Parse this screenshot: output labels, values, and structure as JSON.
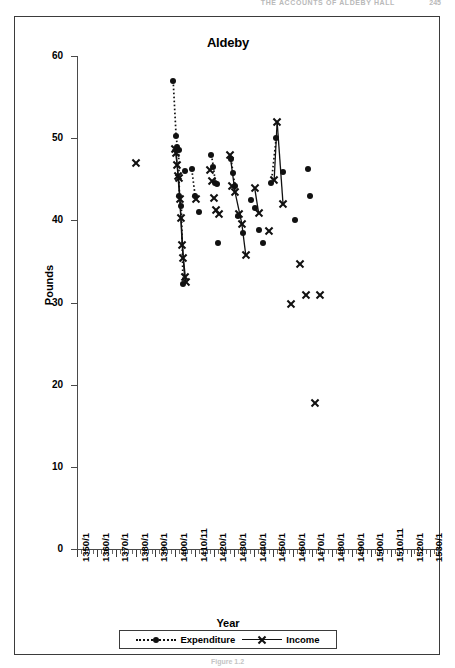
{
  "page": {
    "running_header": "THE ACCOUNTS OF ALDEBY HALL",
    "folio": "245",
    "figure_caption": "Figure 1.2"
  },
  "chart_data": {
    "type": "scatter",
    "title": "Aldeby",
    "xlabel": "Year",
    "ylabel": "Pounds",
    "ylim": [
      0,
      60
    ],
    "ytick_values": [
      0,
      10,
      20,
      30,
      40,
      50,
      60
    ],
    "ytick_labels": [
      "0",
      "10",
      "20",
      "30",
      "40",
      "50",
      "60"
    ],
    "xlim": [
      1350,
      1535
    ],
    "xtick_values": [
      1350,
      1360,
      1370,
      1380,
      1390,
      1400,
      1410,
      1420,
      1430,
      1440,
      1450,
      1460,
      1470,
      1480,
      1490,
      1500,
      1510,
      1520,
      1530
    ],
    "xtick_labels": [
      "1350/1",
      "1360/1",
      "1370/1",
      "1380/1",
      "1390/1",
      "1400/1",
      "1410/11",
      "1420/1",
      "1430/1",
      "1440/1",
      "1450/1",
      "1460/1",
      "1470/1",
      "1480/1",
      "1490/1",
      "1500/1",
      "1510/11",
      "1520/1",
      "1530/1"
    ],
    "minor_tick_step": 2,
    "grid": false,
    "legend_position": "bottom",
    "marker_expenditure": "filled-circle",
    "marker_income": "cross-x",
    "linestyle_expenditure": "dotted",
    "linestyle_income": "solid",
    "color": "#111111",
    "series": [
      {
        "name": "Expenditure",
        "points": [
          [
            1399.0,
            57.0
          ],
          [
            1400.5,
            50.3
          ],
          [
            1401.2,
            48.9
          ],
          [
            1401.8,
            48.6
          ],
          [
            1402.2,
            43.0
          ],
          [
            1403.2,
            41.8
          ],
          [
            1404.0,
            32.2
          ],
          [
            1405.0,
            46.0
          ],
          [
            1408.5,
            46.2
          ],
          [
            1410.2,
            43.0
          ],
          [
            1412.0,
            41.0
          ],
          [
            1418.5,
            48.0
          ],
          [
            1419.5,
            46.5
          ],
          [
            1420.5,
            44.6
          ],
          [
            1421.5,
            44.4
          ],
          [
            1422.0,
            37.2
          ],
          [
            1428.5,
            47.5
          ],
          [
            1429.5,
            45.8
          ],
          [
            1430.5,
            44.2
          ],
          [
            1432.0,
            40.5
          ],
          [
            1434.5,
            38.5
          ],
          [
            1438.5,
            42.5
          ],
          [
            1440.5,
            41.5
          ],
          [
            1443.0,
            38.8
          ],
          [
            1445.0,
            37.3
          ],
          [
            1449.0,
            44.5
          ],
          [
            1451.5,
            50.0
          ],
          [
            1455.0,
            45.9
          ],
          [
            1461.0,
            40.0
          ],
          [
            1467.5,
            46.2
          ],
          [
            1468.5,
            43.0
          ]
        ]
      },
      {
        "name": "Income",
        "points": [
          [
            1380.0,
            47.0
          ],
          [
            1400.0,
            48.7
          ],
          [
            1400.6,
            48.3
          ],
          [
            1401.0,
            46.8
          ],
          [
            1401.4,
            45.5
          ],
          [
            1401.8,
            45.2
          ],
          [
            1402.4,
            42.6
          ],
          [
            1403.0,
            40.3
          ],
          [
            1403.6,
            37.0
          ],
          [
            1404.2,
            35.5
          ],
          [
            1404.8,
            33.2
          ],
          [
            1405.4,
            32.6
          ],
          [
            1410.5,
            42.7
          ],
          [
            1418.0,
            46.2
          ],
          [
            1419.0,
            44.8
          ],
          [
            1420.0,
            42.8
          ],
          [
            1421.0,
            41.3
          ],
          [
            1422.5,
            40.8
          ],
          [
            1428.0,
            48.0
          ],
          [
            1429.0,
            44.2
          ],
          [
            1430.5,
            43.5
          ],
          [
            1432.5,
            40.8
          ],
          [
            1434.0,
            39.6
          ],
          [
            1436.0,
            35.8
          ],
          [
            1440.5,
            44.0
          ],
          [
            1442.5,
            41.0
          ],
          [
            1448.0,
            38.8
          ],
          [
            1450.5,
            45.0
          ],
          [
            1452.0,
            52.0
          ],
          [
            1455.0,
            42.0
          ],
          [
            1459.0,
            29.9
          ],
          [
            1463.5,
            34.8
          ],
          [
            1466.5,
            31.0
          ],
          [
            1471.5,
            17.8
          ],
          [
            1474.0,
            31.0
          ]
        ]
      }
    ],
    "connected_runs": {
      "Expenditure": [
        [
          [
            1399.0,
            57.0
          ],
          [
            1400.5,
            50.3
          ],
          [
            1401.2,
            48.9
          ]
        ],
        [
          [
            1401.8,
            48.6
          ],
          [
            1402.2,
            43.0
          ],
          [
            1403.2,
            41.8
          ],
          [
            1404.0,
            32.2
          ]
        ],
        [
          [
            1408.5,
            46.2
          ],
          [
            1410.2,
            43.0
          ]
        ],
        [
          [
            1418.5,
            48.0
          ],
          [
            1419.5,
            46.5
          ],
          [
            1420.5,
            44.6
          ]
        ],
        [
          [
            1428.5,
            47.5
          ],
          [
            1429.5,
            45.8
          ],
          [
            1430.5,
            44.2
          ]
        ],
        [
          [
            1449.0,
            44.5
          ],
          [
            1451.5,
            50.0
          ]
        ]
      ],
      "Income": [
        [
          [
            1400.0,
            48.7
          ],
          [
            1401.0,
            46.8
          ],
          [
            1401.8,
            45.2
          ],
          [
            1403.0,
            40.3
          ],
          [
            1404.2,
            35.5
          ],
          [
            1405.4,
            32.6
          ]
        ],
        [
          [
            1400.6,
            48.3
          ],
          [
            1401.4,
            45.5
          ],
          [
            1402.4,
            42.6
          ],
          [
            1403.6,
            37.0
          ],
          [
            1404.8,
            33.2
          ],
          [
            1405.4,
            32.6
          ]
        ],
        [
          [
            1428.0,
            48.0
          ],
          [
            1430.5,
            43.5
          ],
          [
            1434.0,
            39.6
          ],
          [
            1436.0,
            35.8
          ]
        ],
        [
          [
            1440.5,
            44.0
          ],
          [
            1442.5,
            41.0
          ]
        ],
        [
          [
            1450.5,
            45.0
          ],
          [
            1452.0,
            52.0
          ]
        ],
        [
          [
            1452.0,
            52.0
          ],
          [
            1455.0,
            42.0
          ]
        ]
      ]
    }
  },
  "legend": {
    "items": [
      {
        "label": "Expenditure",
        "marker": "filled-circle",
        "linestyle": "dotted"
      },
      {
        "label": "Income",
        "marker": "cross-x",
        "linestyle": "solid"
      }
    ]
  }
}
